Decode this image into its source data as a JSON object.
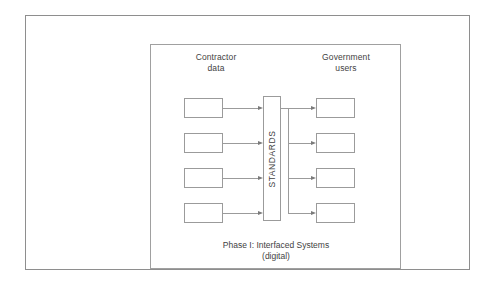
{
  "figure": {
    "caption": "Phase I: Interfaced Systems\n(digital)",
    "colors": {
      "line": "#9b9b9b",
      "frame": "#8e8e8e",
      "text": "#3f3f3f",
      "background": "#ffffff",
      "arrowhead": "#7a7a7a"
    }
  },
  "diagram": {
    "type": "block-flow",
    "columns": {
      "left": {
        "header": "Contractor\ndata",
        "nodes": [
          {
            "label": ""
          },
          {
            "label": ""
          },
          {
            "label": ""
          },
          {
            "label": ""
          }
        ]
      },
      "center": {
        "label": "STANDARDS",
        "orientation": "vertical"
      },
      "right": {
        "header": "Government\nusers",
        "nodes": [
          {
            "label": ""
          },
          {
            "label": ""
          },
          {
            "label": ""
          },
          {
            "label": ""
          }
        ]
      }
    },
    "flow_direction": "left-to-right"
  }
}
